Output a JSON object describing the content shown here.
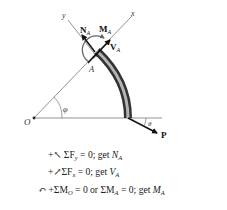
{
  "diagram": {
    "labels": {
      "origin": "O",
      "point_a": "A",
      "x_axis": "x",
      "y_axis": "y",
      "angle_phi": "φ",
      "angle_theta": "θ",
      "force_p": "P",
      "normal_force": "N",
      "normal_force_sub": "A",
      "moment": "M",
      "moment_sub": "A",
      "shear_force": "V",
      "shear_force_sub": "A"
    },
    "colors": {
      "line": "#555555",
      "arrow": "#111111",
      "member_dark": "#4a4a4a",
      "member_light": "#b0b0b0",
      "moment_arc": "#666666"
    }
  },
  "equations": [
    {
      "prefix": "+↖ ΣF",
      "sub": "y",
      "middle": " = 0; get ",
      "result": "N",
      "result_sub": "A"
    },
    {
      "prefix": "+↗ΣF",
      "sub": "x",
      "middle": " = 0; get ",
      "result": "V",
      "result_sub": "A"
    },
    {
      "prefix": "↶ +ΣM",
      "sub": "O",
      "middle": " = 0 or ΣM",
      "sub2": "A",
      "middle2": " = 0; get ",
      "result": "M",
      "result_sub": "A"
    }
  ]
}
